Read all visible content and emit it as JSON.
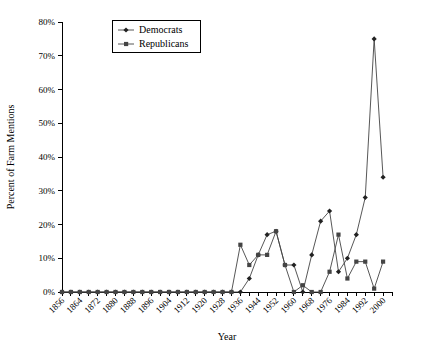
{
  "chart_data": {
    "type": "line",
    "title": "",
    "xlabel": "Year",
    "ylabel": "Percent of Farm Mentions",
    "xlim": [
      1856,
      2004
    ],
    "ylim": [
      0,
      80
    ],
    "ytick_values": [
      0,
      10,
      20,
      30,
      40,
      50,
      60,
      70,
      80
    ],
    "ytick_labels": [
      "0%",
      "10%",
      "20%",
      "30%",
      "40%",
      "50%",
      "60%",
      "70%",
      "80%"
    ],
    "xtick_labels": [
      "1856",
      "1864",
      "1872",
      "1880",
      "1888",
      "1896",
      "1904",
      "1912",
      "1920",
      "1928",
      "1936",
      "1944",
      "1952",
      "1960",
      "1968",
      "1976",
      "1984",
      "1992",
      "2000"
    ],
    "xtick_label_values": [
      1856,
      1864,
      1872,
      1880,
      1888,
      1896,
      1904,
      1912,
      1920,
      1928,
      1936,
      1944,
      1952,
      1960,
      1968,
      1976,
      1984,
      1992,
      2000
    ],
    "xtick_minor_values": [
      1860,
      1868,
      1876,
      1884,
      1892,
      1900,
      1908,
      1916,
      1924,
      1932,
      1940,
      1948,
      1956,
      1964,
      1972,
      1980,
      1988,
      1996,
      2004
    ],
    "grid": false,
    "legend_position": "top-center",
    "x": [
      1856,
      1860,
      1864,
      1868,
      1872,
      1876,
      1880,
      1884,
      1888,
      1892,
      1896,
      1900,
      1904,
      1908,
      1912,
      1916,
      1920,
      1924,
      1928,
      1932,
      1936,
      1940,
      1944,
      1948,
      1952,
      1956,
      1960,
      1964,
      1968,
      1972,
      1976,
      1980,
      1984,
      1988,
      1992,
      1996,
      2000
    ],
    "series": [
      {
        "name": "Democrats",
        "color": "#222222",
        "marker": "diamond",
        "values": [
          0,
          0,
          0,
          0,
          0,
          0,
          0,
          0,
          0,
          0,
          0,
          0,
          0,
          0,
          0,
          0,
          0,
          0,
          0,
          0,
          0,
          4,
          11,
          17,
          18,
          8,
          8,
          0,
          11,
          21,
          24,
          6,
          10,
          17,
          28,
          75,
          34
        ]
      },
      {
        "name": "Republicans",
        "color": "#444444",
        "marker": "square",
        "values": [
          0,
          0,
          0,
          0,
          0,
          0,
          0,
          0,
          0,
          0,
          0,
          0,
          0,
          0,
          0,
          0,
          0,
          0,
          0,
          0,
          14,
          8,
          11,
          11,
          18,
          8,
          0,
          2,
          0,
          0,
          6,
          17,
          4,
          9,
          9,
          1,
          9
        ]
      }
    ]
  },
  "legend": {
    "items": [
      {
        "label": "Democrats"
      },
      {
        "label": "Republicans"
      }
    ]
  }
}
